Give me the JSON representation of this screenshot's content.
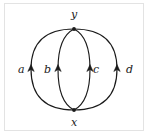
{
  "figure": {
    "type": "directed-multigraph",
    "stroke_color": "#1a1a1a",
    "frame_color": "#e3e3e3",
    "background_color": "#ffffff"
  },
  "vertices": [
    {
      "id": "y",
      "label": "y",
      "position": "top",
      "x": 74,
      "y": 29,
      "label_x": 71,
      "label_y": 9
    },
    {
      "id": "x",
      "label": "x",
      "position": "bottom",
      "x": 74,
      "y": 110,
      "label_x": 71,
      "label_y": 117
    }
  ],
  "edges": [
    {
      "id": "a",
      "label": "a",
      "from": "x",
      "to": "y",
      "shape": "outer-left-arc",
      "direction": "upward",
      "label_x": 18,
      "label_y": 64,
      "arrow_x": 31,
      "arrow_y": 69
    },
    {
      "id": "b",
      "label": "b",
      "from": "x",
      "to": "y",
      "shape": "inner-left-arc",
      "direction": "upward",
      "label_x": 44,
      "label_y": 64,
      "arrow_x": 58,
      "arrow_y": 69
    },
    {
      "id": "c",
      "label": "c",
      "from": "x",
      "to": "y",
      "shape": "inner-right-arc",
      "direction": "upward",
      "label_x": 93,
      "label_y": 64,
      "arrow_x": 90,
      "arrow_y": 69
    },
    {
      "id": "d",
      "label": "d",
      "from": "x",
      "to": "y",
      "shape": "outer-right-arc",
      "direction": "upward",
      "label_x": 126,
      "label_y": 64,
      "arrow_x": 117,
      "arrow_y": 69
    }
  ]
}
